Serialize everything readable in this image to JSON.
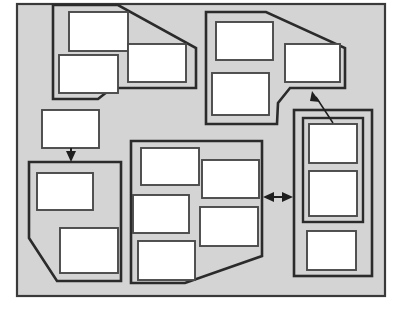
{
  "diagram": {
    "canvas": {
      "width": 402,
      "height": 314
    },
    "colors": {
      "background": "#ffffff",
      "frame_fill": "#d4d4d4",
      "frame_stroke": "#3a3a3a",
      "group_stroke": "#2b2b2b",
      "node_fill": "#ffffff",
      "node_stroke": "#4a4a4a",
      "connector": "#1e1e1e"
    },
    "frame": {
      "label": "",
      "x": 17,
      "y": 4,
      "width": 368,
      "height": 292
    },
    "groups": [
      {
        "id": "group-top-left",
        "label": "",
        "shape": "polygon",
        "points": "53,5 118,5 196,48 196,88 112,88 98,99 53,99",
        "nodes": [
          {
            "id": "node-tl-1",
            "label": "",
            "x": 69,
            "y": 12,
            "width": 59,
            "height": 39
          },
          {
            "id": "node-tl-2",
            "label": "",
            "x": 59,
            "y": 55,
            "width": 59,
            "height": 38
          },
          {
            "id": "node-tl-3",
            "label": "",
            "x": 128,
            "y": 44,
            "width": 58,
            "height": 38
          }
        ]
      },
      {
        "id": "group-top-right",
        "label": "",
        "shape": "polygon",
        "points": "206,12 266,12 345,48 345,88 290,88 278,103 277,124 206,124",
        "nodes": [
          {
            "id": "node-tr-1",
            "label": "",
            "x": 216,
            "y": 22,
            "width": 57,
            "height": 38
          },
          {
            "id": "node-tr-2",
            "label": "",
            "x": 212,
            "y": 73,
            "width": 57,
            "height": 42
          },
          {
            "id": "node-tr-3",
            "label": "",
            "x": 285,
            "y": 44,
            "width": 55,
            "height": 38
          }
        ]
      },
      {
        "id": "group-bottom-left",
        "label": "",
        "shape": "polygon",
        "points": "29,162 121,162 121,281 57,281 29,238",
        "nodes": [
          {
            "id": "node-bl-1",
            "label": "",
            "x": 37,
            "y": 173,
            "width": 56,
            "height": 37
          },
          {
            "id": "node-bl-2",
            "label": "",
            "x": 60,
            "y": 228,
            "width": 58,
            "height": 45
          }
        ]
      },
      {
        "id": "group-center",
        "label": "",
        "shape": "polygon",
        "points": "131,141 262,141 262,256 185,283 131,283",
        "nodes": [
          {
            "id": "node-c-1",
            "label": "",
            "x": 141,
            "y": 148,
            "width": 58,
            "height": 37
          },
          {
            "id": "node-c-2",
            "label": "",
            "x": 202,
            "y": 160,
            "width": 57,
            "height": 38
          },
          {
            "id": "node-c-3",
            "label": "",
            "x": 133,
            "y": 195,
            "width": 56,
            "height": 38
          },
          {
            "id": "node-c-4",
            "label": "",
            "x": 200,
            "y": 207,
            "width": 58,
            "height": 39
          },
          {
            "id": "node-c-5",
            "label": "",
            "x": 138,
            "y": 241,
            "width": 57,
            "height": 39
          }
        ]
      },
      {
        "id": "group-right-outer",
        "label": "",
        "shape": "rectangle",
        "x": 294,
        "y": 110,
        "width": 78,
        "height": 166,
        "inner_group": {
          "id": "group-right-inner",
          "label": "",
          "shape": "rectangle",
          "x": 303,
          "y": 118,
          "width": 60,
          "height": 104
        },
        "nodes": [
          {
            "id": "node-r-1",
            "label": "",
            "x": 309,
            "y": 124,
            "width": 48,
            "height": 39
          },
          {
            "id": "node-r-2",
            "label": "",
            "x": 309,
            "y": 171,
            "width": 48,
            "height": 45
          },
          {
            "id": "node-r-3",
            "label": "",
            "x": 307,
            "y": 231,
            "width": 49,
            "height": 39
          }
        ]
      }
    ],
    "standalone_nodes": [
      {
        "id": "node-standalone-left",
        "label": "",
        "x": 42,
        "y": 110,
        "width": 57,
        "height": 38
      }
    ],
    "connectors": [
      {
        "id": "connector-down-arrow",
        "label": "",
        "type": "arrow",
        "direction": "down",
        "from": "node-standalone-left",
        "to": "group-bottom-left",
        "x1": 71,
        "y1": 148,
        "x2": 71,
        "y2": 161
      },
      {
        "id": "connector-bidirectional",
        "label": "",
        "type": "double-arrow",
        "direction": "horizontal",
        "from": "group-center",
        "to": "group-right-outer",
        "x1": 264,
        "y1": 197,
        "x2": 292,
        "y2": 197
      },
      {
        "id": "connector-diagonal-arrow",
        "label": "",
        "type": "arrow",
        "direction": "up-left",
        "from": "group-right-outer",
        "to": "group-top-right",
        "x1": 333,
        "y1": 122,
        "x2": 313,
        "y2": 92
      }
    ]
  }
}
